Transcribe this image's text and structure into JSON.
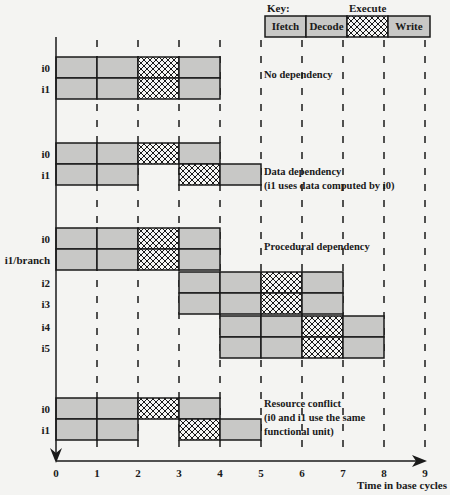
{
  "key": {
    "title": "Key:",
    "execute_label": "Execute",
    "stages": [
      "Ifetch",
      "Decode",
      "",
      "Write"
    ]
  },
  "axis": {
    "xlabel": "Time in base cycles",
    "ticks": [
      "0",
      "1",
      "2",
      "3",
      "4",
      "5",
      "6",
      "7",
      "8",
      "9"
    ]
  },
  "sections": [
    {
      "name": "no-dependency",
      "caption": [
        "No dependency"
      ],
      "rows": [
        {
          "label": "i0",
          "stages": [
            [
              0,
              1,
              "F"
            ],
            [
              1,
              2,
              "D"
            ],
            [
              2,
              3,
              "E"
            ],
            [
              3,
              4,
              "W"
            ]
          ]
        },
        {
          "label": "i1",
          "stages": [
            [
              0,
              1,
              "F"
            ],
            [
              1,
              2,
              "D"
            ],
            [
              2,
              3,
              "E"
            ],
            [
              3,
              4,
              "W"
            ]
          ]
        }
      ]
    },
    {
      "name": "data-dependency",
      "caption": [
        "Data dependency",
        "(i1 uses data computed by i0)"
      ],
      "rows": [
        {
          "label": "i0",
          "stages": [
            [
              0,
              1,
              "F"
            ],
            [
              1,
              2,
              "D"
            ],
            [
              2,
              3,
              "E"
            ],
            [
              3,
              4,
              "W"
            ]
          ]
        },
        {
          "label": "i1",
          "stages": [
            [
              0,
              1,
              "F"
            ],
            [
              1,
              2,
              "D"
            ],
            [
              3,
              4,
              "E"
            ],
            [
              4,
              5,
              "W"
            ]
          ]
        }
      ]
    },
    {
      "name": "procedural-dependency",
      "caption": [
        "Procedural dependency"
      ],
      "rows": [
        {
          "label": "i0",
          "stages": [
            [
              0,
              1,
              "F"
            ],
            [
              1,
              2,
              "D"
            ],
            [
              2,
              3,
              "E"
            ],
            [
              3,
              4,
              "W"
            ]
          ]
        },
        {
          "label": "i1/branch",
          "stages": [
            [
              0,
              1,
              "F"
            ],
            [
              1,
              2,
              "D"
            ],
            [
              2,
              3,
              "E"
            ],
            [
              3,
              4,
              "W"
            ]
          ]
        },
        {
          "label": "i2",
          "stages": [
            [
              3,
              4,
              "F"
            ],
            [
              4,
              5,
              "D"
            ],
            [
              5,
              6,
              "E"
            ],
            [
              6,
              7,
              "W"
            ]
          ]
        },
        {
          "label": "i3",
          "stages": [
            [
              3,
              4,
              "F"
            ],
            [
              4,
              5,
              "D"
            ],
            [
              5,
              6,
              "E"
            ],
            [
              6,
              7,
              "W"
            ]
          ]
        },
        {
          "label": "i4",
          "stages": [
            [
              4,
              5,
              "F"
            ],
            [
              5,
              6,
              "D"
            ],
            [
              6,
              7,
              "E"
            ],
            [
              7,
              8,
              "W"
            ]
          ]
        },
        {
          "label": "i5",
          "stages": [
            [
              4,
              5,
              "F"
            ],
            [
              5,
              6,
              "D"
            ],
            [
              6,
              7,
              "E"
            ],
            [
              7,
              8,
              "W"
            ]
          ]
        }
      ]
    },
    {
      "name": "resource-conflict",
      "caption": [
        "Resource conflict",
        "(i0 and i1 use the same",
        "functional unit)"
      ],
      "rows": [
        {
          "label": "i0",
          "stages": [
            [
              0,
              1,
              "F"
            ],
            [
              1,
              2,
              "D"
            ],
            [
              2,
              3,
              "E"
            ],
            [
              3,
              4,
              "W"
            ]
          ]
        },
        {
          "label": "i1",
          "stages": [
            [
              0,
              1,
              "F"
            ],
            [
              1,
              2,
              "D"
            ],
            [
              3,
              4,
              "E"
            ],
            [
              4,
              5,
              "W"
            ]
          ]
        }
      ]
    }
  ],
  "colors": {
    "stage_fill": "#c8c8c6",
    "line": "#1a1a1a",
    "background": "#f4f4f2"
  }
}
